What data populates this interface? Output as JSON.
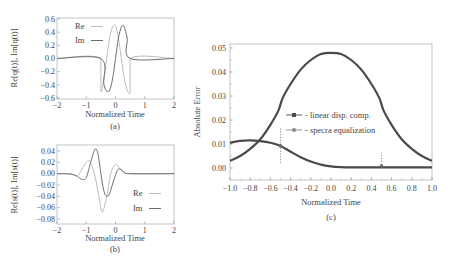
{
  "chart_data": [
    {
      "id": "a",
      "type": "line",
      "caption": "(a)",
      "xlabel": "Normalized Time",
      "ylabel": "Re[q(t)], Im[q(t)]",
      "xlim": [
        -2,
        2
      ],
      "ylim": [
        -0.6,
        0.6
      ],
      "xticks": [
        -2,
        -1,
        0,
        1,
        2
      ],
      "yticks": [
        0.6,
        0.4,
        0.2,
        0.0,
        -0.2,
        -0.4,
        -0.6
      ],
      "ytick_labels": [
        "0.6",
        "0.4",
        "0.2",
        "0.0",
        "−0.2",
        "−0.4",
        "−0.6"
      ],
      "xtick_labels": [
        "−2",
        "−1",
        "0",
        "1",
        "2"
      ],
      "legend": [
        {
          "name": "Re",
          "color": "#bdbdbd"
        },
        {
          "name": "Im",
          "color": "#6e6e6e"
        }
      ],
      "series": [
        {
          "name": "Re",
          "color": "#bdbdbd",
          "x": [
            -2,
            -0.5,
            -0.5,
            -0.4,
            -0.3,
            -0.2,
            -0.1,
            0.0,
            0.1,
            0.2,
            0.3,
            0.4,
            0.5,
            0.5,
            2
          ],
          "y": [
            0,
            0,
            -0.5,
            -0.31,
            0.0,
            0.31,
            0.48,
            0.5,
            0.31,
            0.0,
            -0.31,
            -0.48,
            -0.5,
            0,
            0
          ]
        },
        {
          "name": "Im",
          "color": "#6e6e6e",
          "x": [
            -2,
            -0.5,
            -0.4,
            -0.3,
            -0.25,
            -0.2,
            -0.1,
            0.0,
            0.1,
            0.2,
            0.25,
            0.3,
            0.4,
            0.5,
            2
          ],
          "y": [
            0,
            0,
            -0.38,
            -0.5,
            -0.5,
            -0.48,
            -0.31,
            0.0,
            0.31,
            0.48,
            0.5,
            0.48,
            0.31,
            0,
            0
          ]
        }
      ]
    },
    {
      "id": "b",
      "type": "line",
      "caption": "(b)",
      "xlabel": "Normalized Time",
      "ylabel": "Re[s(t)], Im[s(t)]",
      "xlim": [
        -2,
        2
      ],
      "ylim": [
        -0.09,
        0.05
      ],
      "xticks": [
        -2,
        -1,
        0,
        1,
        2
      ],
      "yticks": [
        0.04,
        0.02,
        0.0,
        -0.02,
        -0.04,
        -0.06,
        -0.08
      ],
      "ytick_labels": [
        "0.04",
        "0.02",
        "0.00",
        "−0.02",
        "−0.04",
        "−0.06",
        "−0.08"
      ],
      "xtick_labels": [
        "−2",
        "−1",
        "0",
        "1",
        "2"
      ],
      "legend": [
        {
          "name": "Re",
          "color": "#bdbdbd"
        },
        {
          "name": "Im",
          "color": "#6e6e6e"
        }
      ],
      "series": [
        {
          "name": "Re",
          "color": "#bdbdbd",
          "x": [
            -2,
            -1.6,
            -1.3,
            -1.1,
            -0.95,
            -0.85,
            -0.7,
            -0.55,
            -0.45,
            -0.3,
            -0.15,
            0.0,
            0.1,
            0.25,
            0.5,
            2
          ],
          "y": [
            0,
            0,
            -0.003,
            0.012,
            0.022,
            0.02,
            -0.005,
            -0.045,
            -0.068,
            -0.04,
            0.002,
            0.017,
            0.012,
            0.004,
            0,
            0
          ]
        },
        {
          "name": "Im",
          "color": "#6e6e6e",
          "x": [
            -2,
            -1.5,
            -1.3,
            -1.15,
            -1.0,
            -0.85,
            -0.7,
            -0.6,
            -0.5,
            -0.4,
            -0.3,
            -0.2,
            -0.05,
            0.1,
            0.3,
            0.5,
            2
          ],
          "y": [
            0,
            -0.001,
            -0.005,
            -0.01,
            -0.007,
            0.02,
            0.043,
            0.035,
            0.0,
            -0.03,
            -0.04,
            -0.035,
            -0.01,
            0.008,
            0.003,
            0,
            0
          ]
        }
      ]
    },
    {
      "id": "c",
      "type": "line",
      "caption": "(c)",
      "xlabel": "Normalized Time",
      "ylabel": "Absolute Error",
      "xlim": [
        -1.0,
        1.0
      ],
      "ylim": [
        -0.005,
        0.052
      ],
      "xticks": [
        -1.0,
        -0.8,
        -0.6,
        -0.4,
        -0.2,
        0.0,
        0.2,
        0.4,
        0.6,
        0.8,
        1.0
      ],
      "xtick_labels": [
        "−1.0",
        "−0.8",
        "−0.6",
        "−0.4",
        "−0.2",
        "0.0",
        "0.2",
        "0.4",
        "0.6",
        "0.8",
        "1.0"
      ],
      "yticks": [
        0.05,
        0.04,
        0.03,
        0.02,
        0.01,
        0.0
      ],
      "ytick_labels": [
        "0.05",
        "0.04",
        "0.03",
        "0.02",
        "0.01",
        "0.00"
      ],
      "legend": [
        {
          "name": "- linear disp. comp.",
          "marker": "square",
          "color": "#4a4a4a"
        },
        {
          "name": "- specra equalization",
          "marker": "circle",
          "color": "#8a8a8a"
        }
      ],
      "series": [
        {
          "name": "linear disp. comp.",
          "color": "#4a4a4a",
          "x": [
            -1.0,
            -0.9,
            -0.8,
            -0.7,
            -0.6,
            -0.52,
            -0.48,
            -0.4,
            -0.3,
            -0.2,
            -0.1,
            0.0,
            0.1,
            0.2,
            0.3,
            0.4,
            0.48,
            0.52,
            0.6,
            0.7,
            0.8,
            0.9,
            1.0
          ],
          "y": [
            0.003,
            0.005,
            0.008,
            0.012,
            0.018,
            0.024,
            0.029,
            0.035,
            0.041,
            0.045,
            0.0475,
            0.048,
            0.0475,
            0.045,
            0.041,
            0.035,
            0.029,
            0.024,
            0.018,
            0.012,
            0.008,
            0.005,
            0.003
          ]
        },
        {
          "name": "specra equalization",
          "color": "#4a4a4a",
          "x": [
            -1.0,
            -0.9,
            -0.8,
            -0.7,
            -0.6,
            -0.5,
            -0.4,
            -0.3,
            -0.2,
            -0.1,
            0.0,
            0.1,
            0.2,
            0.4,
            0.6,
            0.8,
            1.0
          ],
          "y": [
            0.0105,
            0.0113,
            0.0115,
            0.0112,
            0.0105,
            0.0092,
            0.0068,
            0.0045,
            0.0027,
            0.0014,
            0.0007,
            0.0004,
            0.0003,
            0.0003,
            0.0003,
            0.0003,
            0.0003
          ]
        }
      ],
      "error_bars": [
        {
          "x": -0.5,
          "y": 0.0092,
          "low": 0.002,
          "high": 0.017
        },
        {
          "x": 0.5,
          "y": 0.0008,
          "low": 0.0002,
          "high": 0.007
        }
      ]
    }
  ]
}
